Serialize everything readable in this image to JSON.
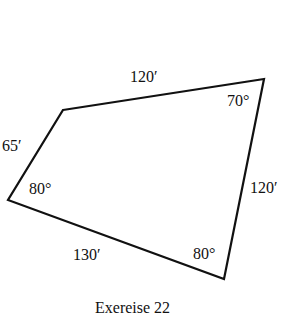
{
  "diagram": {
    "type": "quadrilateral",
    "caption": "Exereise 22",
    "vertices": {
      "top_left": [
        63,
        110
      ],
      "top_right": [
        264,
        79
      ],
      "bottom": [
        224,
        279
      ],
      "left": [
        8,
        200
      ]
    },
    "sides": {
      "top": "120′",
      "right": "120′",
      "bottom": "130′",
      "left": "65′"
    },
    "angles": {
      "top_right": "70°",
      "bottom": "80°",
      "left": "80°"
    },
    "stroke_color": "#111111"
  }
}
